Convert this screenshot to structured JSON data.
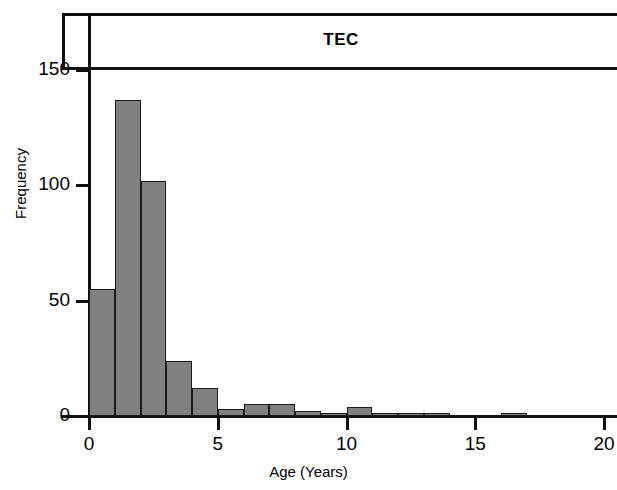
{
  "chart_data": {
    "type": "bar",
    "title": "TEC",
    "xlabel": "Age (Years)",
    "ylabel": "Frequency",
    "xlim": [
      0,
      20.5
    ],
    "ylim": [
      0,
      150
    ],
    "grid": false,
    "legend": null,
    "bin_width": 1,
    "bar_color": "#808080",
    "bar_edge_color": "#1a1a1a",
    "x_ticks": [
      "0",
      "5",
      "10",
      "15",
      "20"
    ],
    "x_tick_values": [
      0,
      5,
      10,
      15,
      20
    ],
    "y_ticks": [
      "0",
      "50",
      "100",
      "150"
    ],
    "y_tick_values": [
      0,
      50,
      100,
      150
    ],
    "categories": [
      "0-1",
      "1-2",
      "2-3",
      "3-4",
      "4-5",
      "5-6",
      "6-7",
      "7-8",
      "8-9",
      "9-10",
      "10-11",
      "11-12",
      "12-13",
      "13-14",
      "14-15",
      "15-16",
      "16-17"
    ],
    "bin_starts": [
      0,
      1,
      2,
      3,
      4,
      5,
      6,
      7,
      8,
      9,
      10,
      11,
      12,
      13,
      14,
      15,
      16
    ],
    "values": [
      55,
      137,
      102,
      24,
      12,
      3,
      5,
      5,
      2,
      1,
      4,
      1,
      1,
      1,
      0,
      0,
      1
    ]
  }
}
